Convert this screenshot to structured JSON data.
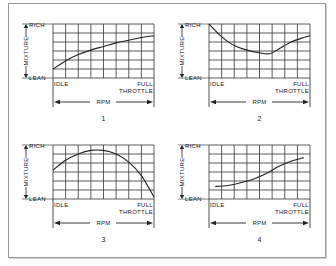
{
  "chart_data": [
    {
      "type": "line",
      "caption": "1",
      "ylabel": "MIXTURE",
      "y_top_label": "RICH",
      "y_bottom_label": "LEAN",
      "x_left_label": "IDLE",
      "x_right_label": [
        "FULL",
        "THROTTLE"
      ],
      "xlabel": "RPM",
      "grid": true,
      "grid_columns": 8,
      "grid_rows": 6,
      "xlim": [
        0,
        8
      ],
      "ylim": [
        0,
        6
      ],
      "points": [
        [
          0,
          1.0
        ],
        [
          1,
          1.9
        ],
        [
          2,
          2.6
        ],
        [
          3,
          3.1
        ],
        [
          4,
          3.5
        ],
        [
          5,
          3.9
        ],
        [
          6,
          4.2
        ],
        [
          7,
          4.5
        ],
        [
          8,
          4.7
        ]
      ]
    },
    {
      "type": "line",
      "caption": "2",
      "ylabel": "MIXTURE",
      "y_top_label": "RICH",
      "y_bottom_label": "LEAN",
      "x_left_label": "IDLE",
      "x_right_label": [
        "FULL",
        "THROTTLE"
      ],
      "xlabel": "RPM",
      "grid": true,
      "grid_columns": 8,
      "grid_rows": 6,
      "xlim": [
        0,
        8
      ],
      "ylim": [
        0,
        6
      ],
      "points": [
        [
          0,
          6.0
        ],
        [
          1,
          4.6
        ],
        [
          2,
          3.6
        ],
        [
          3,
          3.1
        ],
        [
          4,
          2.8
        ],
        [
          4.8,
          2.7
        ],
        [
          5.5,
          3.2
        ],
        [
          6.5,
          4.0
        ],
        [
          7.5,
          4.5
        ],
        [
          8,
          4.7
        ]
      ]
    },
    {
      "type": "line",
      "caption": "3",
      "ylabel": "MIXTURE",
      "y_top_label": "RICH",
      "y_bottom_label": "LEAN",
      "x_left_label": "IDLE",
      "x_right_label": [
        "FULL",
        "THROTTLE"
      ],
      "xlabel": "RPM",
      "grid": true,
      "grid_columns": 8,
      "grid_rows": 6,
      "xlim": [
        0,
        8
      ],
      "ylim": [
        0,
        6
      ],
      "points": [
        [
          0,
          3.2
        ],
        [
          1,
          4.3
        ],
        [
          2,
          5.0
        ],
        [
          3,
          5.4
        ],
        [
          4,
          5.4
        ],
        [
          5,
          5.0
        ],
        [
          6,
          4.1
        ],
        [
          7,
          2.6
        ],
        [
          8,
          0.2
        ]
      ]
    },
    {
      "type": "line",
      "caption": "4",
      "ylabel": "MIXTURE",
      "y_top_label": "RICH",
      "y_bottom_label": "LEAN",
      "x_left_label": "IDLE",
      "x_right_label": [
        "FULL",
        "THROTTLE"
      ],
      "xlabel": "RPM",
      "grid": true,
      "grid_columns": 8,
      "grid_rows": 6,
      "xlim": [
        0,
        8
      ],
      "ylim": [
        0,
        6
      ],
      "points": [
        [
          0.5,
          1.4
        ],
        [
          1.5,
          1.5
        ],
        [
          2.5,
          1.8
        ],
        [
          3.5,
          2.2
        ],
        [
          4.5,
          2.8
        ],
        [
          5.5,
          3.6
        ],
        [
          6.5,
          4.2
        ],
        [
          7.5,
          4.6
        ]
      ]
    }
  ],
  "colors": {
    "line": "#222222",
    "grid": "#333333",
    "frame": "#9a9a9a"
  }
}
